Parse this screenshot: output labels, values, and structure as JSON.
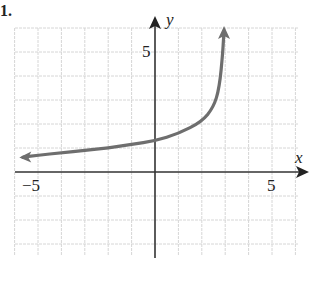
{
  "problem_number": "1.",
  "chart_data": {
    "type": "line",
    "title": "",
    "xlabel": "x",
    "ylabel": "y",
    "xlim": [
      -6,
      6
    ],
    "ylim": [
      -3.5,
      6
    ],
    "grid": true,
    "x_tick_labels": [
      "-5",
      "5"
    ],
    "y_tick_labels": [
      "5"
    ],
    "series": [
      {
        "name": "f(x)",
        "description": "increasing curve with vertical asymptote near x = 3; arrows at both ends",
        "x": [
          -5.8,
          -5,
          -4,
          -3,
          -2,
          -1,
          0,
          1,
          2,
          2.5,
          2.75,
          2.9,
          2.95
        ],
        "y": [
          0.6,
          0.7,
          0.8,
          0.9,
          1.0,
          1.15,
          1.3,
          1.6,
          2.1,
          2.7,
          3.5,
          5.0,
          6.0
        ]
      }
    ],
    "line_color": "#6e6e6e"
  },
  "labels": {
    "x_axis": "x",
    "y_axis": "y",
    "x_neg5": "−5",
    "x_pos5": "5",
    "y_pos5": "5"
  }
}
